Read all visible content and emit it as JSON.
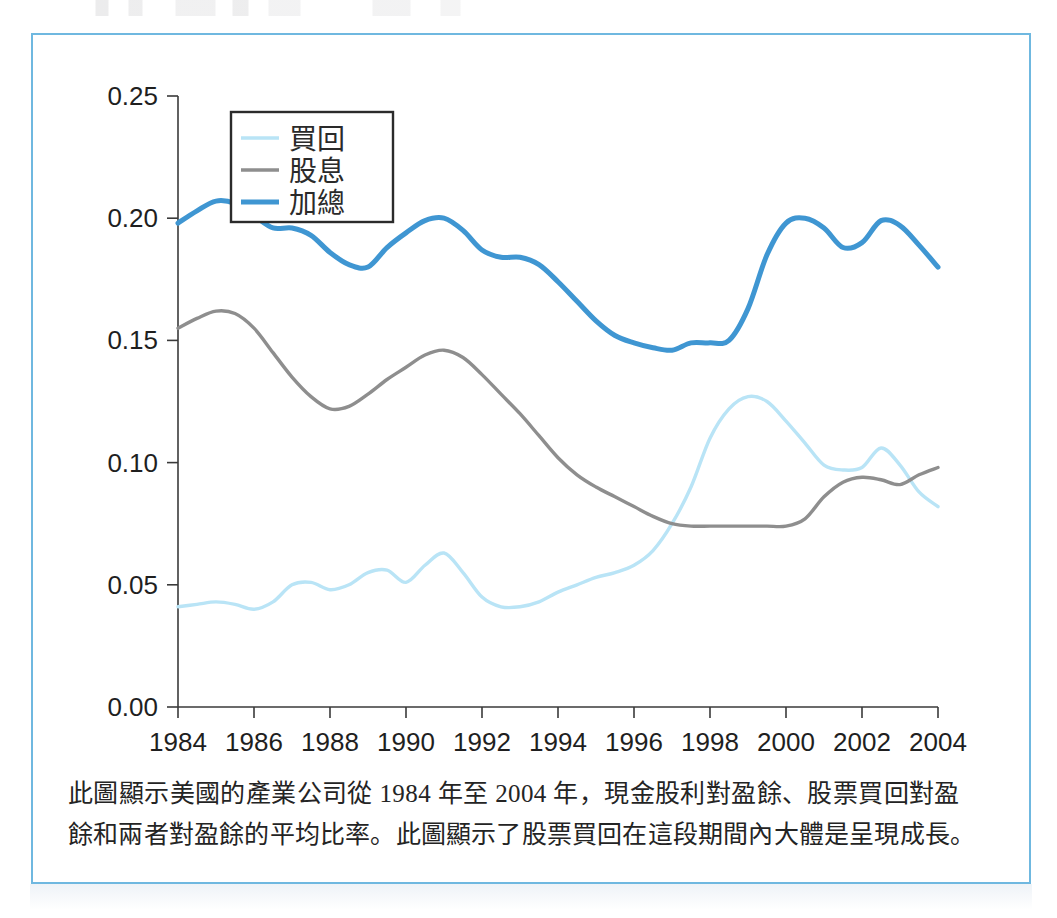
{
  "figure": {
    "frame_color": "#6fb8e0",
    "caption_lines": [
      "此圖顯示美國的產業公司從 1984 年至 2004 年，現金股利對盈餘、股票買回對盈",
      "餘和兩者對盈餘的平均比率。此圖顯示了股票買回在這段期間內大體是呈現成長。"
    ]
  },
  "legend": {
    "position": "top-left-inside-plot",
    "entries": [
      {
        "label": "買回",
        "color": "#b9e4f6"
      },
      {
        "label": "股息",
        "color": "#8e8e8e"
      },
      {
        "label": "加總",
        "color": "#3f96d2"
      }
    ]
  },
  "axes": {
    "y_ticks": [
      "0.00",
      "0.05",
      "0.10",
      "0.15",
      "0.20",
      "0.25"
    ],
    "x_ticks": [
      "1984",
      "1986",
      "1988",
      "1990",
      "1992",
      "1994",
      "1996",
      "1998",
      "2000",
      "2002",
      "2004"
    ]
  },
  "chart_data": {
    "type": "line",
    "title": "",
    "xlabel": "",
    "ylabel": "",
    "xlim": [
      1984,
      2004
    ],
    "ylim": [
      0.0,
      0.25
    ],
    "grid": false,
    "legend_position": "upper left",
    "x": [
      1984,
      1984.5,
      1985,
      1985.5,
      1986,
      1986.5,
      1987,
      1987.5,
      1988,
      1988.5,
      1989,
      1989.5,
      1990,
      1990.5,
      1991,
      1991.5,
      1992,
      1992.5,
      1993,
      1993.5,
      1994,
      1994.5,
      1995,
      1995.5,
      1996,
      1996.5,
      1997,
      1997.5,
      1998,
      1998.5,
      1999,
      1999.5,
      2000,
      2000.5,
      2001,
      2001.5,
      2002,
      2002.5,
      2003,
      2003.5,
      2004
    ],
    "series": [
      {
        "name": "買回",
        "color": "#b9e4f6",
        "values": [
          0.041,
          0.042,
          0.043,
          0.042,
          0.04,
          0.043,
          0.05,
          0.051,
          0.048,
          0.05,
          0.055,
          0.056,
          0.051,
          0.058,
          0.063,
          0.055,
          0.045,
          0.041,
          0.041,
          0.043,
          0.047,
          0.05,
          0.053,
          0.055,
          0.058,
          0.064,
          0.075,
          0.09,
          0.11,
          0.122,
          0.127,
          0.125,
          0.117,
          0.108,
          0.099,
          0.097,
          0.098,
          0.106,
          0.099,
          0.088,
          0.082
        ]
      },
      {
        "name": "股息",
        "color": "#8e8e8e",
        "values": [
          0.155,
          0.159,
          0.162,
          0.161,
          0.155,
          0.145,
          0.135,
          0.127,
          0.122,
          0.123,
          0.128,
          0.134,
          0.139,
          0.144,
          0.146,
          0.143,
          0.136,
          0.128,
          0.12,
          0.111,
          0.102,
          0.095,
          0.09,
          0.086,
          0.082,
          0.078,
          0.075,
          0.074,
          0.074,
          0.074,
          0.074,
          0.074,
          0.074,
          0.077,
          0.086,
          0.092,
          0.094,
          0.093,
          0.091,
          0.095,
          0.098
        ]
      },
      {
        "name": "加總",
        "color": "#3f96d2",
        "values": [
          0.198,
          0.203,
          0.207,
          0.206,
          0.201,
          0.196,
          0.196,
          0.193,
          0.186,
          0.181,
          0.18,
          0.188,
          0.194,
          0.199,
          0.2,
          0.195,
          0.187,
          0.184,
          0.184,
          0.181,
          0.174,
          0.166,
          0.158,
          0.152,
          0.149,
          0.147,
          0.146,
          0.149,
          0.149,
          0.15,
          0.163,
          0.185,
          0.198,
          0.2,
          0.196,
          0.188,
          0.19,
          0.199,
          0.197,
          0.189,
          0.18
        ]
      }
    ]
  }
}
